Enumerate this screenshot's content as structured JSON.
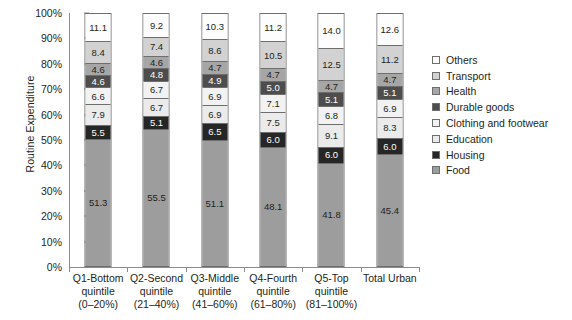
{
  "chart_data": {
    "type": "bar",
    "subtype": "stacked-percentage-column",
    "title": "",
    "xlabel": "",
    "ylabel": "Routine Expenditure",
    "ylim": [
      0,
      100
    ],
    "y_tick_labels": [
      "0%",
      "10%",
      "20%",
      "30%",
      "40%",
      "50%",
      "60%",
      "70%",
      "80%",
      "90%",
      "100%"
    ],
    "y_tick_values": [
      0,
      10,
      20,
      30,
      40,
      50,
      60,
      70,
      80,
      90,
      100
    ],
    "grid": false,
    "legend_position": "right",
    "categories": [
      "Q1-Bottom quintile (0–20%)",
      "Q2-Second quintile (21–40%)",
      "Q3-Middle quintile (41–60%)",
      "Q4-Fourth quintile (61–80%)",
      "Q5-Top quintile (81–100%)",
      "Total Urban"
    ],
    "category_lines": [
      [
        "Q1-Bottom",
        "quintile",
        "(0–20%)"
      ],
      [
        "Q2-Second",
        "quintile",
        "(21–40%)"
      ],
      [
        "Q3-Middle",
        "quintile",
        "(41–60%)"
      ],
      [
        "Q4-Fourth",
        "quintile",
        "(61–80%)"
      ],
      [
        "Q5-Top",
        "quintile",
        "(81–100%)"
      ],
      [
        "Total Urban"
      ]
    ],
    "series": [
      {
        "name": "Others",
        "color": "#fdfdfd",
        "text_color": "#231f20",
        "values": [
          11.1,
          9.2,
          10.3,
          11.2,
          14.0,
          12.6
        ]
      },
      {
        "name": "Transport",
        "color": "#d2d2d2",
        "text_color": "#231f20",
        "values": [
          8.4,
          7.4,
          8.6,
          10.5,
          12.5,
          11.2
        ]
      },
      {
        "name": "Health",
        "color": "#a6a6a6",
        "text_color": "#231f20",
        "values": [
          4.6,
          4.6,
          4.7,
          4.7,
          4.7,
          4.7
        ]
      },
      {
        "name": "Durable goods",
        "color": "#4d4d4d",
        "text_color": "#ffffff",
        "values": [
          4.6,
          4.8,
          4.9,
          5.0,
          5.1,
          5.1
        ]
      },
      {
        "name": "Clothing and footwear",
        "color": "#f2f2f2",
        "text_color": "#231f20",
        "values": [
          6.6,
          6.7,
          6.9,
          7.1,
          6.8,
          6.9
        ]
      },
      {
        "name": "Education",
        "color": "#ebebeb",
        "text_color": "#231f20",
        "values": [
          7.9,
          6.7,
          6.9,
          7.5,
          9.1,
          8.3
        ]
      },
      {
        "name": "Housing",
        "color": "#262626",
        "text_color": "#ffffff",
        "values": [
          5.5,
          5.1,
          6.5,
          6.0,
          6.0,
          6.0
        ]
      },
      {
        "name": "Food",
        "color": "#9d9d9d",
        "text_color": "#231f20",
        "values": [
          51.3,
          55.5,
          51.1,
          48.1,
          41.8,
          45.4
        ]
      }
    ],
    "value_labels": [
      [
        "11.1",
        "8.4",
        "4.6",
        "4.6",
        "6.6",
        "7.9",
        "5.5",
        "51.3"
      ],
      [
        "9.2",
        "7.4",
        "4.6",
        "4.8",
        "6.7",
        "6.7",
        "5.1",
        "55.5"
      ],
      [
        "10.3",
        "8.6",
        "4.7",
        "4.9",
        "6.9",
        "6.9",
        "6.5",
        "51.1"
      ],
      [
        "11.2",
        "10.5",
        "4.7",
        "5.0",
        "7.1",
        "7.5",
        "6.0",
        "48.1"
      ],
      [
        "14.0",
        "12.5",
        "4.7",
        "5.1",
        "6.8",
        "9.1",
        "6.0",
        "41.8"
      ],
      [
        "12.6",
        "11.2",
        "4.7",
        "5.1",
        "6.9",
        "8.3",
        "6.0",
        "45.4"
      ]
    ]
  },
  "legend": {
    "items": [
      {
        "label": "Others"
      },
      {
        "label": "Transport"
      },
      {
        "label": "Health"
      },
      {
        "label": "Durable goods"
      },
      {
        "label": "Clothing and footwear"
      },
      {
        "label": "Education"
      },
      {
        "label": "Housing"
      },
      {
        "label": "Food"
      }
    ]
  }
}
